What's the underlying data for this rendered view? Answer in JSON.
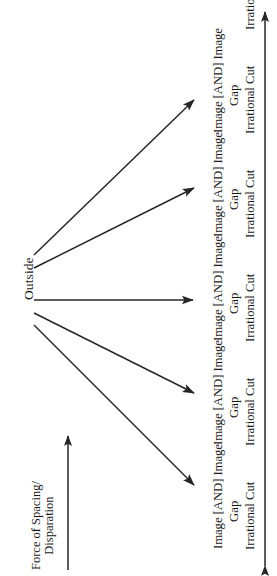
{
  "diagram": {
    "orientation": "rotated-90-ccw",
    "source_node": {
      "label": "Outside"
    },
    "axis": {
      "label_line1": "Force of Spacing/",
      "label_line2": "Disparation",
      "arrow_name": "force-axis-arrow",
      "direction": "up"
    },
    "range_arrow": {
      "name": "range-double-arrow",
      "direction": "double"
    },
    "branch_count": 5,
    "branches": [
      {
        "main": "Image [AND] Image",
        "gap": "Gap",
        "cut": "Irrational Cut"
      },
      {
        "main": "Image [AND] Image",
        "gap": "Gap",
        "cut": "Irrational Cut"
      },
      {
        "main": "Image [AND] Image",
        "gap": "Gap",
        "cut": "Irrational Cut"
      },
      {
        "main": "Image [AND] Image",
        "gap": "Gap",
        "cut": "Irrational Cut"
      },
      {
        "main": "Image [AND] Image",
        "gap": "Gap",
        "cut": "Irrational Cut"
      }
    ],
    "extra_cuts": [
      {
        "cut": "Irrational Cut"
      }
    ],
    "colors": {
      "ink": "#1a1a1a",
      "background": "#ffffff",
      "stroke": "#262626"
    }
  }
}
